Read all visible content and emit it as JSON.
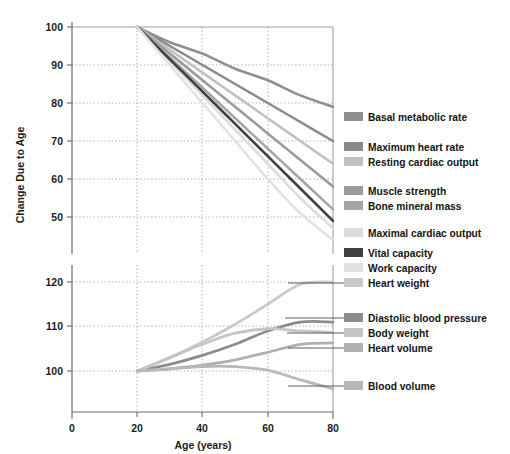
{
  "chart_data": {
    "type": "line",
    "title": "",
    "xlabel": "Age (years)",
    "ylabel": "Change Due to Age",
    "xlim": [
      0,
      80
    ],
    "x_ticks": [
      0,
      20,
      40,
      60,
      80
    ],
    "grid": true,
    "legend_position": "right",
    "note": "Broken y-axis: upper panel shows declining functions (50-100), lower panel shows increasing functions (100-120), both indexed to 100 at age 20",
    "upper_panel": {
      "ylim": [
        50,
        100
      ],
      "y_ticks": [
        50,
        60,
        70,
        80,
        90,
        100
      ]
    },
    "lower_panel": {
      "ylim": [
        100,
        120
      ],
      "y_ticks": [
        100,
        110,
        120
      ]
    },
    "x": [
      20,
      30,
      40,
      50,
      60,
      70,
      80
    ],
    "series": [
      {
        "name": "Basal metabolic rate",
        "panel": "upper",
        "color": "#8f8f8f",
        "values": [
          100,
          96,
          93,
          89,
          86,
          82,
          79
        ]
      },
      {
        "name": "Maximum heart rate",
        "panel": "upper",
        "color": "#8a8a8a",
        "values": [
          100,
          95,
          90,
          85,
          80,
          75,
          70
        ]
      },
      {
        "name": "Resting cardiac output",
        "panel": "upper",
        "color": "#c0c0c0",
        "values": [
          100,
          94,
          88,
          82,
          76,
          70,
          64
        ]
      },
      {
        "name": "Muscle strength",
        "panel": "upper",
        "color": "#9b9b9b",
        "values": [
          100,
          93,
          86,
          79,
          72,
          65,
          58
        ]
      },
      {
        "name": "Bone mineral mass",
        "panel": "upper",
        "color": "#a5a5a5",
        "values": [
          100,
          92,
          84,
          76,
          68,
          60,
          52
        ]
      },
      {
        "name": "Maximal cardiac output",
        "panel": "upper",
        "color": "#dcdcdc",
        "values": [
          100,
          91,
          82,
          73,
          64,
          55,
          47
        ]
      },
      {
        "name": "Vital capacity",
        "panel": "upper",
        "color": "#3f3f3f",
        "values": [
          100,
          91.5,
          83,
          74.5,
          66,
          57.5,
          49
        ]
      },
      {
        "name": "Work capacity",
        "panel": "upper",
        "color": "#e2e2e2",
        "values": [
          100,
          90,
          80,
          70,
          60,
          51,
          44
        ]
      },
      {
        "name": "Heart weight",
        "panel": "lower",
        "color": "#c9c9c9",
        "values": [
          100,
          103,
          106.5,
          110.5,
          115,
          119.5,
          120
        ]
      },
      {
        "name": "Diastolic blood pressure",
        "panel": "lower",
        "color": "#8c8c8c",
        "values": [
          100,
          101.5,
          103.5,
          106,
          109,
          111,
          111
        ]
      },
      {
        "name": "Body weight",
        "panel": "lower",
        "color": "#c5c5c5",
        "values": [
          100,
          103,
          106,
          108.5,
          109.5,
          109,
          108.7
        ]
      },
      {
        "name": "Heart volume",
        "panel": "lower",
        "color": "#b0b0b0",
        "values": [
          100,
          100.5,
          101.3,
          102.5,
          104.2,
          106,
          106.3
        ]
      },
      {
        "name": "Blood volume",
        "panel": "lower",
        "color": "#b8b8b8",
        "values": [
          100,
          100.5,
          101,
          101,
          100.2,
          98,
          96
        ]
      }
    ]
  },
  "axes": {
    "y_label": "Change Due to Age",
    "x_label": "Age (years)",
    "y_ticks_upper": [
      "100",
      "90",
      "80",
      "70",
      "60",
      "50"
    ],
    "y_ticks_lower": [
      "120",
      "110",
      "100"
    ],
    "x_ticks": [
      "0",
      "20",
      "40",
      "60",
      "80"
    ]
  },
  "legend": {
    "items": [
      {
        "label": "Basal metabolic rate",
        "color": "#8f8f8f"
      },
      {
        "label": "Maximum heart rate",
        "color": "#8a8a8a"
      },
      {
        "label": "Resting cardiac output",
        "color": "#c0c0c0"
      },
      {
        "label": "Muscle strength",
        "color": "#9b9b9b"
      },
      {
        "label": "Bone mineral mass",
        "color": "#a5a5a5"
      },
      {
        "label": "Maximal cardiac output",
        "color": "#dcdcdc"
      },
      {
        "label": "Vital capacity",
        "color": "#3f3f3f"
      },
      {
        "label": "Work capacity",
        "color": "#e2e2e2"
      },
      {
        "label": "Heart weight",
        "color": "#c9c9c9"
      },
      {
        "label": "Diastolic blood pressure",
        "color": "#8c8c8c"
      },
      {
        "label": "Body weight",
        "color": "#c5c5c5"
      },
      {
        "label": "Heart volume",
        "color": "#b0b0b0"
      },
      {
        "label": "Blood volume",
        "color": "#b8b8b8"
      }
    ]
  }
}
